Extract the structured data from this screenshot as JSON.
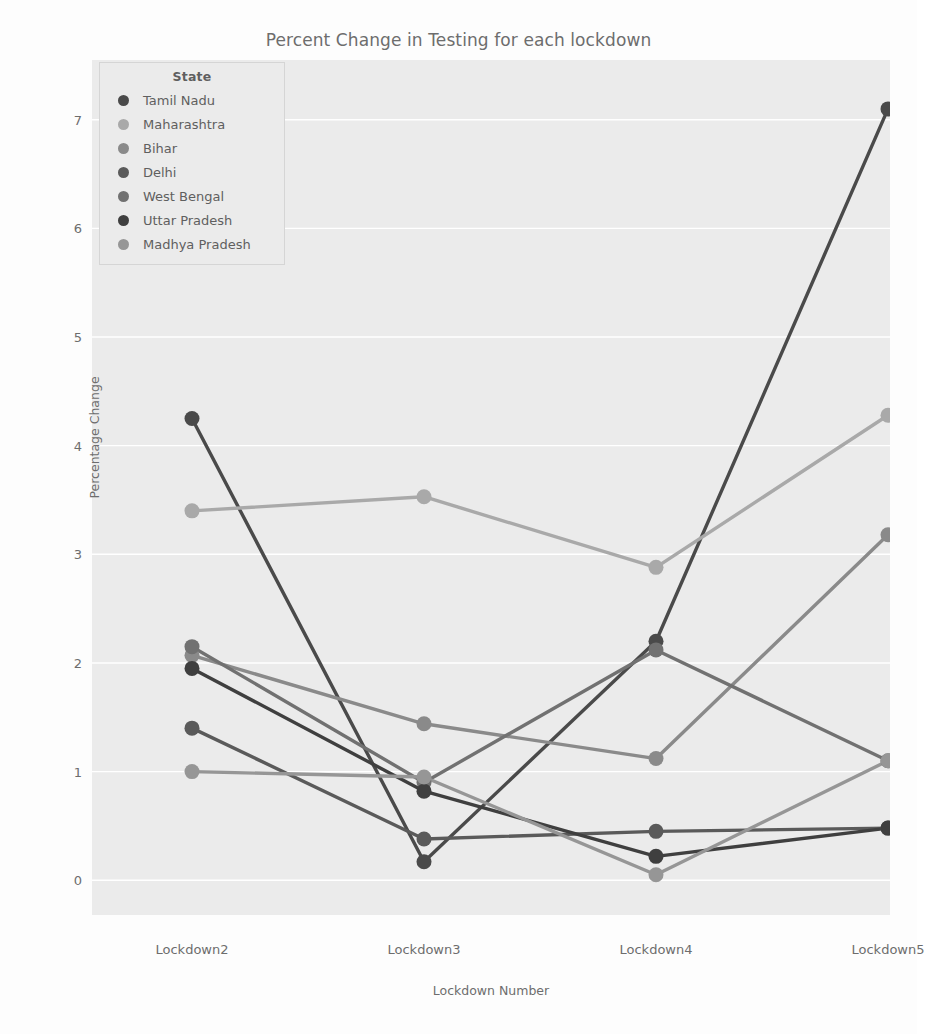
{
  "chart_data": {
    "type": "line",
    "title": "Percent Change in Testing for each lockdown",
    "xlabel": "Lockdown Number",
    "ylabel": "Percentage Change",
    "categories": [
      "Lockdown2",
      "Lockdown3",
      "Lockdown4",
      "Lockdown5"
    ],
    "ytick_labels": [
      "0",
      "1",
      "2",
      "3",
      "4",
      "5",
      "6",
      "7"
    ],
    "ytick_values": [
      0,
      1,
      2,
      3,
      4,
      5,
      6,
      7
    ],
    "ylim": [
      -0.32,
      7.55
    ],
    "grid": true,
    "legend_position": "upper left",
    "legend_title": "State",
    "plot_background": "#ebebeb",
    "grid_color": "#ffffff",
    "series": [
      {
        "name": "Tamil Nadu",
        "color": "#4a4a4a",
        "values": [
          4.25,
          0.17,
          2.2,
          7.1
        ]
      },
      {
        "name": "Maharashtra",
        "color": "#a9a9a9",
        "values": [
          3.4,
          3.53,
          2.88,
          4.28
        ]
      },
      {
        "name": "Bihar",
        "color": "#8a8a8a",
        "values": [
          2.07,
          1.44,
          1.12,
          3.18
        ]
      },
      {
        "name": "Delhi",
        "color": "#5a5a5a",
        "values": [
          1.4,
          0.38,
          0.45,
          0.48
        ]
      },
      {
        "name": "West Bengal",
        "color": "#717171",
        "values": [
          2.15,
          0.9,
          2.12,
          1.1
        ]
      },
      {
        "name": "Uttar Pradesh",
        "color": "#3f3f3f",
        "values": [
          1.95,
          0.82,
          0.22,
          0.48
        ]
      },
      {
        "name": "Madhya Pradesh",
        "color": "#969696",
        "values": [
          1.0,
          0.95,
          0.05,
          1.1
        ]
      }
    ]
  }
}
